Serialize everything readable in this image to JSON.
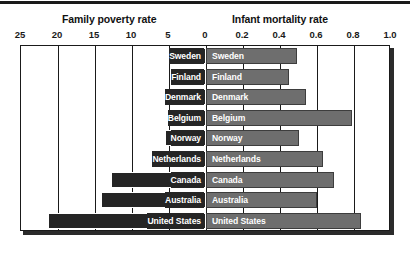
{
  "chart_data": {
    "type": "bar",
    "orientation": "horizontal",
    "style": "bidirectional-pyramid",
    "title": "",
    "panels": [
      {
        "name": "poverty",
        "title": "Family poverty rate",
        "side": "left",
        "axis_ticks": [
          "25",
          "20",
          "15",
          "10",
          "5",
          "0"
        ],
        "tick_values": [
          25,
          20,
          15,
          10,
          5,
          0
        ],
        "axis_min": 0,
        "axis_max": 25,
        "direction": "reversed",
        "color": "#252525"
      },
      {
        "name": "mortality",
        "title": "Infant mortality rate",
        "side": "right",
        "axis_ticks": [
          "0",
          "0.2",
          "0.4",
          "0.6",
          "0.8",
          "1.0"
        ],
        "tick_values": [
          0,
          0.2,
          0.4,
          0.6,
          0.8,
          1.0
        ],
        "axis_min": 0,
        "axis_max": 1.0,
        "direction": "normal",
        "color": "#6e6e6e"
      }
    ],
    "categories": [
      "Sweden",
      "Finland",
      "Denmark",
      "Belgium",
      "Norway",
      "Netherlands",
      "Canada",
      "Australia",
      "United States"
    ],
    "series": [
      {
        "name": "Family poverty rate",
        "panel": "poverty",
        "values": [
          3.0,
          3.0,
          4.0,
          4.8,
          5.5,
          6.7,
          12.8,
          14.2,
          21.4
        ]
      },
      {
        "name": "Infant mortality rate",
        "panel": "mortality",
        "values": [
          0.49,
          0.45,
          0.54,
          0.79,
          0.5,
          0.63,
          0.69,
          0.6,
          0.84
        ]
      }
    ],
    "grid": true,
    "legend": false,
    "xlabel": "",
    "ylabel": ""
  },
  "rows": [
    {
      "label": "Sweden",
      "poverty": 3.0,
      "mortality": 0.49
    },
    {
      "label": "Finland",
      "poverty": 3.0,
      "mortality": 0.45
    },
    {
      "label": "Denmark",
      "poverty": 4.0,
      "mortality": 0.54
    },
    {
      "label": "Belgium",
      "poverty": 4.8,
      "mortality": 0.79
    },
    {
      "label": "Norway",
      "poverty": 5.5,
      "mortality": 0.5
    },
    {
      "label": "Netherlands",
      "poverty": 6.7,
      "mortality": 0.63
    },
    {
      "label": "Canada",
      "poverty": 12.8,
      "mortality": 0.69
    },
    {
      "label": "Australia",
      "poverty": 14.2,
      "mortality": 0.6
    },
    {
      "label": "United States",
      "poverty": 21.4,
      "mortality": 0.84
    }
  ],
  "headers": {
    "left": "Family poverty rate",
    "right": "Infant mortality rate"
  },
  "ticks": {
    "left": [
      "25",
      "20",
      "15",
      "10",
      "5",
      "0"
    ],
    "right": [
      "0.2",
      "0.4",
      "0.6",
      "0.8",
      "1.0"
    ]
  },
  "colors": {
    "poverty_bar": "#252525",
    "mortality_bar": "#6e6e6e",
    "mortality_bar_border": "#3d3d3d",
    "frame": "#1a1a1a",
    "shadow": "#2b2b2b",
    "background": "#ffffff",
    "bar_text": "#ffffff"
  }
}
